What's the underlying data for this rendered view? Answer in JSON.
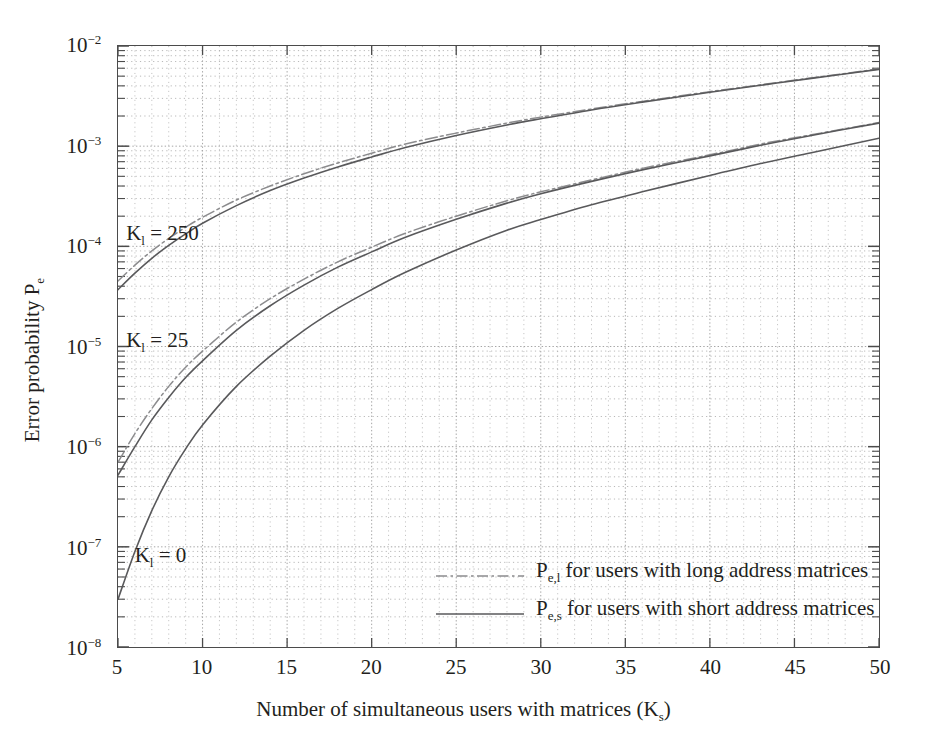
{
  "chart_data": {
    "type": "line",
    "title": "",
    "xlabel": "Number of simultaneous users with matrices (K_s)",
    "ylabel": "Error probability P_e",
    "xscale": "linear",
    "yscale": "log",
    "xlim": [
      5,
      50
    ],
    "ylim": [
      1e-08,
      0.01
    ],
    "grid": "major and minor dotted, both axes",
    "legend_position": "inside lower-center-right",
    "xticks": [
      5,
      10,
      15,
      20,
      25,
      30,
      35,
      40,
      45,
      50
    ],
    "ytick_labels": [
      "10-2",
      "10-3",
      "10-4",
      "10-5",
      "10-6",
      "10-7",
      "10-8"
    ],
    "yticks": [
      0.01,
      0.001,
      0.0001,
      1e-05,
      1e-06,
      1e-07,
      1e-08
    ],
    "annotations": [
      {
        "text": "K_l = 250",
        "x": 5.6,
        "y": 0.00013
      },
      {
        "text": "K_l = 25",
        "x": 5.6,
        "y": 1.1e-05
      },
      {
        "text": "K_l = 0",
        "x": 6.1,
        "y": 8e-08
      }
    ],
    "x": [
      5,
      6,
      7,
      8,
      9,
      10,
      12,
      14,
      16,
      18,
      20,
      22,
      25,
      28,
      30,
      33,
      36,
      40,
      43,
      46,
      50
    ],
    "series": [
      {
        "name": "P_e,l for users with long address matrices, K_l = 250",
        "style": "dash-dot",
        "group": "Kl=250",
        "values": [
          4.5e-05,
          6.5e-05,
          9e-05,
          0.00012,
          0.000155,
          0.000195,
          0.00029,
          0.0004,
          0.00053,
          0.00068,
          0.00085,
          0.00105,
          0.00135,
          0.0017,
          0.00195,
          0.00235,
          0.0028,
          0.0035,
          0.0041,
          0.0048,
          0.0059
        ]
      },
      {
        "name": "P_e,s for users with short address matrices, K_l = 250",
        "style": "solid",
        "group": "Kl=250",
        "values": [
          3.7e-05,
          5.4e-05,
          7.6e-05,
          0.000102,
          0.000133,
          0.00017,
          0.000255,
          0.00036,
          0.00048,
          0.00062,
          0.00078,
          0.00097,
          0.00128,
          0.00163,
          0.00188,
          0.0023,
          0.00275,
          0.00345,
          0.00405,
          0.00475,
          0.00585
        ]
      },
      {
        "name": "P_e,l for users with long address matrices, K_l = 25",
        "style": "dash-dot",
        "group": "Kl=25",
        "values": [
          7e-07,
          1.35e-06,
          2.4e-06,
          4e-06,
          6.2e-06,
          9e-06,
          1.75e-05,
          3e-05,
          4.7e-05,
          7e-05,
          9.8e-05,
          0.000135,
          0.0002,
          0.000285,
          0.00035,
          0.00046,
          0.0006,
          0.00082,
          0.00105,
          0.0013,
          0.00172
        ]
      },
      {
        "name": "P_e,s for users with short address matrices, K_l = 25",
        "style": "solid",
        "group": "Kl=25",
        "values": [
          5.2e-07,
          1e-06,
          1.85e-06,
          3.1e-06,
          4.9e-06,
          7.2e-06,
          1.45e-05,
          2.55e-05,
          4.1e-05,
          6.2e-05,
          8.8e-05,
          0.000123,
          0.000186,
          0.00027,
          0.000335,
          0.000445,
          0.00058,
          0.0008,
          0.00102,
          0.00128,
          0.0017
        ]
      },
      {
        "name": "P_e,s for users with short address matrices, K_l = 0",
        "style": "solid",
        "group": "Kl=0",
        "values": [
          3e-08,
          9e-08,
          2.3e-07,
          5e-07,
          9.5e-07,
          1.65e-06,
          4e-06,
          8e-06,
          1.45e-05,
          2.4e-05,
          3.7e-05,
          5.5e-05,
          9.2e-05,
          0.000145,
          0.000185,
          0.00026,
          0.00035,
          0.00051,
          0.00067,
          0.00086,
          0.0012
        ]
      }
    ],
    "legend_entries": [
      {
        "label_html": "Pe,l for users with long address matrices",
        "style": "dash-dot"
      },
      {
        "label_html": "Pe,s for users with short address matrices",
        "style": "solid"
      }
    ]
  },
  "axis": {
    "y_ticks": [
      {
        "mantissa": "10",
        "exp": "-2"
      },
      {
        "mantissa": "10",
        "exp": "-3"
      },
      {
        "mantissa": "10",
        "exp": "-4"
      },
      {
        "mantissa": "10",
        "exp": "-5"
      },
      {
        "mantissa": "10",
        "exp": "-6"
      },
      {
        "mantissa": "10",
        "exp": "-7"
      },
      {
        "mantissa": "10",
        "exp": "-8"
      }
    ],
    "x_ticks": [
      "5",
      "10",
      "15",
      "20",
      "25",
      "30",
      "35",
      "40",
      "45",
      "50"
    ],
    "x_title_main": "Number of simultaneous users with matrices (K",
    "x_title_sub": "s",
    "x_title_tail": ")",
    "y_title_main": "Error probability P",
    "y_title_sub": "e"
  },
  "annotations": [
    {
      "main": "K",
      "sub": "l",
      "tail": " = 250"
    },
    {
      "main": "K",
      "sub": "l",
      "tail": " = 25"
    },
    {
      "main": "K",
      "sub": "l",
      "tail": " = 0"
    }
  ],
  "legend": [
    {
      "main": "P",
      "sub": "e,l",
      "tail": " for users with long address matrices"
    },
    {
      "main": "P",
      "sub": "e,s",
      "tail": " for users with short address matrices"
    }
  ],
  "colors": {
    "axis": "#4b4b4b",
    "grid": "#9a9a9a",
    "curve_solid": "#59595b",
    "curve_dashdot": "#8c8c8e",
    "text": "#231f20"
  }
}
